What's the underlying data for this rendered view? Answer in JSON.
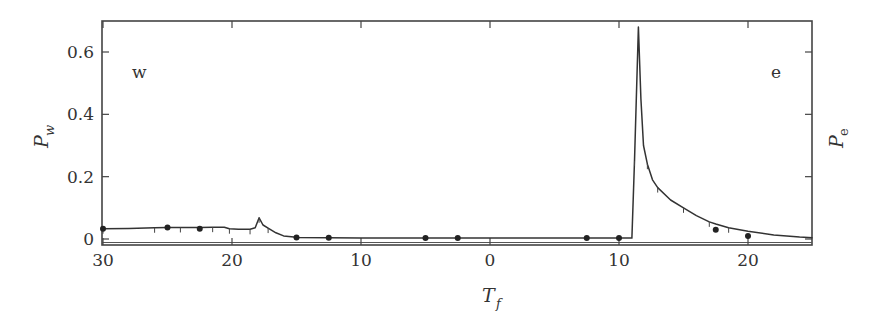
{
  "chart_data": {
    "type": "line",
    "title": "",
    "xlabel": "T_f",
    "xlabel_main": "T",
    "xlabel_sub": "f",
    "ylabel_left": "P_w",
    "ylabel_left_main": "P",
    "ylabel_left_sub": "w",
    "ylabel_right": "P_e",
    "ylabel_right_main": "P",
    "ylabel_right_sub": "e",
    "grid": false,
    "x_description": "Two-sided temperature axis: left half decreasing from 30 to 0 (w side), right half increasing from 0 to 25 (e side). Values stored as signed position s where s = -T on the w side and s = +T on the e side.",
    "x_range_signed": [
      -30,
      25
    ],
    "x_ticks": [
      {
        "s": -30,
        "label": "30"
      },
      {
        "s": -20,
        "label": "20"
      },
      {
        "s": -10,
        "label": "10"
      },
      {
        "s": 0,
        "label": "0"
      },
      {
        "s": 10,
        "label": "10"
      },
      {
        "s": 20,
        "label": "20"
      }
    ],
    "ylim": [
      -0.01,
      0.7
    ],
    "y_ticks": [
      {
        "v": 0,
        "label": "0"
      },
      {
        "v": 0.2,
        "label": "0.2"
      },
      {
        "v": 0.4,
        "label": "0.4"
      },
      {
        "v": 0.6,
        "label": "0.6"
      }
    ],
    "annotations": [
      {
        "text": "w",
        "position": "top-left"
      },
      {
        "text": "e",
        "position": "top-right"
      }
    ],
    "series": [
      {
        "name": "P",
        "style": "line",
        "points": [
          [
            -30,
            0.033
          ],
          [
            -28,
            0.034
          ],
          [
            -26,
            0.036
          ],
          [
            -25,
            0.037
          ],
          [
            -24,
            0.037
          ],
          [
            -22.5,
            0.037
          ],
          [
            -21.5,
            0.038
          ],
          [
            -20.6,
            0.038
          ],
          [
            -20.2,
            0.033
          ],
          [
            -19.5,
            0.031
          ],
          [
            -18.6,
            0.031
          ],
          [
            -18.2,
            0.036
          ],
          [
            -17.9,
            0.068
          ],
          [
            -17.6,
            0.045
          ],
          [
            -17.2,
            0.035
          ],
          [
            -16.6,
            0.02
          ],
          [
            -16.0,
            0.01
          ],
          [
            -15.2,
            0.006
          ],
          [
            -15,
            0.005
          ],
          [
            -12.5,
            0.004
          ],
          [
            -10,
            0.003
          ],
          [
            -5,
            0.003
          ],
          [
            -2.5,
            0.003
          ],
          [
            0,
            0.003
          ],
          [
            5,
            0.003
          ],
          [
            7.5,
            0.003
          ],
          [
            10,
            0.003
          ],
          [
            11.0,
            0.003
          ],
          [
            11.2,
            0.25
          ],
          [
            11.5,
            0.68
          ],
          [
            11.7,
            0.45
          ],
          [
            11.9,
            0.3
          ],
          [
            12.2,
            0.24
          ],
          [
            12.6,
            0.19
          ],
          [
            13.0,
            0.165
          ],
          [
            14.0,
            0.125
          ],
          [
            15.0,
            0.1
          ],
          [
            16.0,
            0.075
          ],
          [
            17.0,
            0.055
          ],
          [
            17.5,
            0.048
          ],
          [
            18.5,
            0.036
          ],
          [
            20,
            0.025
          ],
          [
            22,
            0.013
          ],
          [
            24,
            0.006
          ],
          [
            25,
            0.004
          ]
        ]
      },
      {
        "name": "markers",
        "style": "points",
        "points": [
          [
            -30,
            0.033
          ],
          [
            -25,
            0.037
          ],
          [
            -22.5,
            0.033
          ],
          [
            -15,
            0.005
          ],
          [
            -12.5,
            0.004
          ],
          [
            -5,
            0.003
          ],
          [
            -2.5,
            0.003
          ],
          [
            7.5,
            0.003
          ],
          [
            10,
            0.003
          ],
          [
            17.5,
            0.03
          ],
          [
            20,
            0.01
          ]
        ]
      }
    ]
  }
}
